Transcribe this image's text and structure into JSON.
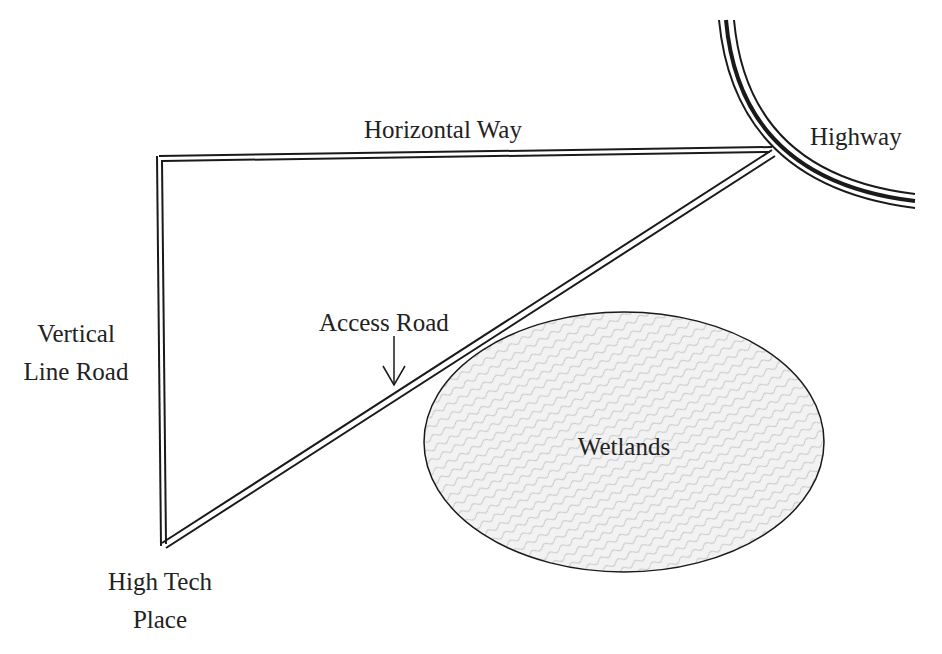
{
  "diagram": {
    "type": "road map",
    "labels": {
      "horizontal_way": "Horizontal Way",
      "highway": "Highway",
      "vertical_line_road_1": "Vertical",
      "vertical_line_road_2": "Line Road",
      "access_road": "Access Road",
      "high_tech_place_1": "High Tech",
      "high_tech_place_2": "Place",
      "wetlands": "Wetlands"
    },
    "colors": {
      "line": "#1a1a1a",
      "text": "#222222",
      "wetlands_fill": "#efefef",
      "wetlands_hatch": "#a8a8a8"
    }
  }
}
